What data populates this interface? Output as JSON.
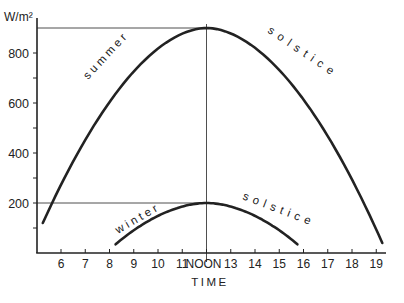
{
  "chart_data": {
    "type": "line",
    "title": "",
    "xlabel": "TIME",
    "ylabel": "W/m²",
    "xlim": [
      5,
      19.5
    ],
    "ylim": [
      0,
      940
    ],
    "x_ticks": [
      {
        "value": 6,
        "label": "6"
      },
      {
        "value": 7,
        "label": "7"
      },
      {
        "value": 8,
        "label": "8"
      },
      {
        "value": 9,
        "label": "9"
      },
      {
        "value": 10,
        "label": "10"
      },
      {
        "value": 11,
        "label": "11"
      },
      {
        "value": 12,
        "label": "NOON"
      },
      {
        "value": 13,
        "label": "13"
      },
      {
        "value": 14,
        "label": "14"
      },
      {
        "value": 15,
        "label": "15"
      },
      {
        "value": 16,
        "label": "16"
      },
      {
        "value": 17,
        "label": "17"
      },
      {
        "value": 18,
        "label": "18"
      },
      {
        "value": 19,
        "label": "19"
      }
    ],
    "y_ticks": [
      {
        "value": 100,
        "label": ""
      },
      {
        "value": 200,
        "label": "200"
      },
      {
        "value": 300,
        "label": ""
      },
      {
        "value": 400,
        "label": "400"
      },
      {
        "value": 500,
        "label": ""
      },
      {
        "value": 600,
        "label": "600"
      },
      {
        "value": 700,
        "label": ""
      },
      {
        "value": 800,
        "label": "800"
      }
    ],
    "grid": false,
    "legend": "none (curves labeled inline)",
    "series": [
      {
        "name": "summer solstice",
        "label_left": "summer",
        "label_right": "solstice",
        "start": [
          5.25,
          120
        ],
        "peak": [
          12,
          900
        ],
        "end": [
          19.25,
          40
        ],
        "x": [
          5.25,
          6,
          7,
          8,
          9,
          10,
          11,
          12,
          13,
          14,
          15,
          16,
          17,
          18,
          19,
          19.25
        ],
        "values": [
          120,
          290,
          480,
          630,
          750,
          835,
          885,
          900,
          885,
          835,
          750,
          630,
          480,
          290,
          80,
          40
        ]
      },
      {
        "name": "winter solstice",
        "label_left": "winter",
        "label_right": "solstice",
        "start": [
          8.25,
          35
        ],
        "peak": [
          12,
          200
        ],
        "end": [
          15.75,
          35
        ],
        "x": [
          8.25,
          9,
          10,
          11,
          12,
          13,
          14,
          15,
          15.75
        ],
        "values": [
          35,
          90,
          150,
          188,
          200,
          188,
          150,
          90,
          35
        ]
      }
    ],
    "annotations": [
      {
        "type": "hline",
        "y": 900,
        "x_from": 5,
        "x_to": 12,
        "note": "summer noon peak reference"
      },
      {
        "type": "hline",
        "y": 200,
        "x_from": 5,
        "x_to": 12,
        "note": "winter noon peak reference"
      },
      {
        "type": "vline",
        "x": 12,
        "y_from": 0,
        "y_to": 900,
        "note": "solar noon"
      }
    ]
  },
  "colors": {
    "ink": "#222222",
    "background": "#ffffff"
  }
}
